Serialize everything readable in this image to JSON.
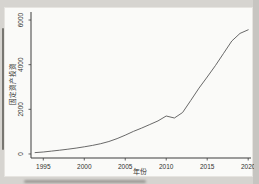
{
  "window": {
    "background_color": "#d6d4d0",
    "figure_background_color": "#fafaf8"
  },
  "chart_data": {
    "type": "line",
    "title": "",
    "xlabel": "年份",
    "ylabel": "固定资产投资",
    "x": [
      1994,
      1995,
      1996,
      1997,
      1998,
      1999,
      2000,
      2001,
      2002,
      2003,
      2004,
      2005,
      2006,
      2007,
      2008,
      2009,
      2010,
      2011,
      2012,
      2013,
      2014,
      2015,
      2016,
      2017,
      2018,
      2019,
      2020
    ],
    "y": [
      60,
      90,
      130,
      170,
      215,
      265,
      320,
      385,
      460,
      560,
      690,
      840,
      1010,
      1160,
      1320,
      1480,
      1700,
      1610,
      1860,
      2400,
      2950,
      3450,
      3960,
      4510,
      5060,
      5400,
      5560
    ],
    "xticks": [
      1995,
      2000,
      2005,
      2010,
      2015,
      2020
    ],
    "xtick_labels": [
      "1995",
      "2000",
      "2005",
      "2010",
      "2015",
      "2020"
    ],
    "yticks": [
      0,
      2000,
      4000,
      6000
    ],
    "ytick_labels": [
      "0",
      "2000",
      "4000",
      "6000"
    ],
    "xlim": [
      1993.5,
      2020.1
    ],
    "ylim": [
      -180,
      6180
    ],
    "grid": false,
    "legend": null,
    "ytick_label_rotation_deg": 90,
    "line_color": "#585858",
    "axis_color": "#3c3c3c",
    "annotations": []
  }
}
